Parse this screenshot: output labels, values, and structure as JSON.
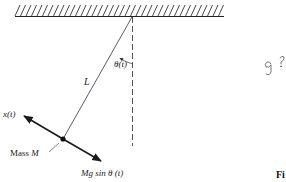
{
  "diagram": {
    "ceiling": {
      "x1": 15,
      "x2": 224,
      "y": 16,
      "hatch_spacing": 5.5
    },
    "pivot": {
      "x": 132,
      "y": 16
    },
    "mass_point": {
      "x": 63,
      "y": 139
    },
    "vertical_reference": {
      "x": 132,
      "y1": 16,
      "y2": 146,
      "style": "dashed"
    },
    "labels": {
      "length": "L",
      "angle": "θ(t)",
      "displacement": "x(t)",
      "mass_prefix": "Mass ",
      "mass_symbol": "M",
      "force": "Mg sin θ (t)",
      "handwritten_note_g": "g",
      "handwritten_note_q": "?",
      "figure_caption_fragment": "Fi"
    },
    "arrows": {
      "displacement_tip": {
        "x": 24,
        "y": 116
      },
      "force_tip": {
        "x": 101,
        "y": 161
      }
    },
    "colors": {
      "ink": "#1a1a1a",
      "line": "#333333",
      "dashed": "#555555",
      "handwriting": "#555555"
    }
  }
}
